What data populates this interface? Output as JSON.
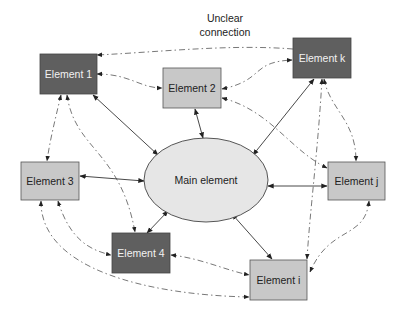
{
  "diagram": {
    "annotation": {
      "line1": "Unclear",
      "line2": "connection"
    },
    "center": {
      "id": "main",
      "label": "Main element",
      "fill": "#e6e6e6"
    },
    "nodes": [
      {
        "id": "e1",
        "label": "Element 1",
        "style": "dark"
      },
      {
        "id": "e2",
        "label": "Element 2",
        "style": "light"
      },
      {
        "id": "ek",
        "label": "Element k",
        "style": "dark"
      },
      {
        "id": "e3",
        "label": "Element 3",
        "style": "light"
      },
      {
        "id": "e4",
        "label": "Element 4",
        "style": "dark"
      },
      {
        "id": "ej",
        "label": "Element j",
        "style": "light"
      },
      {
        "id": "ei",
        "label": "Element i",
        "style": "light"
      }
    ],
    "colors": {
      "dark_box": "#5f5f5f",
      "light_box": "#c8c8c8",
      "ellipse": "#e6e6e6",
      "line": "#333333"
    },
    "solid_connections": [
      [
        "main",
        "e1"
      ],
      [
        "main",
        "e2"
      ],
      [
        "main",
        "ek"
      ],
      [
        "main",
        "e3"
      ],
      [
        "main",
        "e4"
      ],
      [
        "main",
        "ej"
      ],
      [
        "main",
        "ei"
      ]
    ],
    "dashed_connections": [
      [
        "ek",
        "e1"
      ],
      [
        "e1",
        "e2"
      ],
      [
        "e2",
        "ek"
      ],
      [
        "e1",
        "e3"
      ],
      [
        "e1",
        "e4"
      ],
      [
        "e2",
        "ej"
      ],
      [
        "e3",
        "e4"
      ],
      [
        "e3",
        "ei"
      ],
      [
        "e4",
        "ei"
      ],
      [
        "ek",
        "ej"
      ],
      [
        "ek",
        "ei"
      ],
      [
        "ej",
        "ei"
      ]
    ]
  }
}
